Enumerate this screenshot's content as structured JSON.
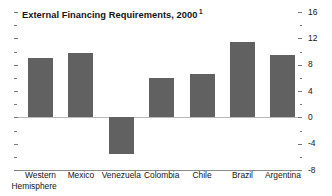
{
  "chart_data": {
    "type": "bar",
    "title": "External Financing Requirements, 2000",
    "title_footnote_marker": "1",
    "xlabel": "",
    "ylabel": "",
    "categories": [
      "Western Hemisphere",
      "Mexico",
      "Venezuela",
      "Colombia",
      "Chile",
      "Brazil",
      "Argentina"
    ],
    "category_lines": [
      [
        "Western",
        "Hemisphere"
      ],
      [
        "Mexico",
        ""
      ],
      [
        "Venezuela",
        ""
      ],
      [
        "Colombia",
        ""
      ],
      [
        "Chile",
        ""
      ],
      [
        "Brazil",
        ""
      ],
      [
        "Argentina",
        ""
      ]
    ],
    "values": [
      9.0,
      9.8,
      -5.5,
      6.0,
      6.6,
      11.5,
      9.5
    ],
    "ylim": [
      -8,
      16
    ],
    "y_ticks_major": [
      16,
      12,
      8,
      4,
      0,
      -4,
      -8
    ],
    "y_tick_labels": [
      "16",
      "12",
      "8",
      "4",
      "0",
      "-4",
      "-8"
    ],
    "y_ticks_minor": [
      14,
      10,
      6,
      2,
      -2,
      -6
    ],
    "axis_position": "right",
    "grid": false,
    "legend": "none",
    "bar_color": "#616161",
    "zero_line_color": "#b9b9b9",
    "axis_line_color": "#8a8a8a",
    "background_color": "#ffffff"
  }
}
